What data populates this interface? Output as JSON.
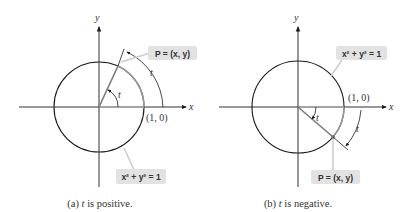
{
  "colors": {
    "circle": "#1a1a1a",
    "axis": "#1a1a1a",
    "radius": "#7a7a7a",
    "highlight_arc": "#9a9a9a",
    "label_box": "#e2e2e2",
    "leader": "#c8c8c8"
  },
  "panel_a": {
    "axis_x_label": "x",
    "axis_y_label": "y",
    "point_label": "P = (x, y)",
    "equation_label": "x² + y² = 1",
    "angle_label": "t",
    "arc_label": "t",
    "origin_point_label": "(1, 0)",
    "caption_prefix": "(a) ",
    "caption_var": "t",
    "caption_suffix": " is positive."
  },
  "panel_b": {
    "axis_x_label": "x",
    "axis_y_label": "y",
    "point_label": "P = (x, y)",
    "equation_label": "x² + y² = 1",
    "angle_label": "t",
    "arc_label": "t",
    "origin_point_label": "(1, 0)",
    "caption_prefix": "(b) ",
    "caption_var": "t",
    "caption_suffix": " is negative."
  }
}
